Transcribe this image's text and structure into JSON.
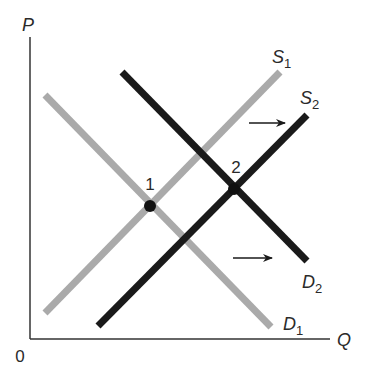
{
  "diagram": {
    "type": "supply-demand",
    "axes": {
      "y_label": "P",
      "x_label": "Q",
      "origin_label": "0"
    },
    "curves": [
      {
        "id": "S1",
        "name": "S",
        "subscript": "1",
        "kind": "supply",
        "color": "#aaaaaa"
      },
      {
        "id": "S2",
        "name": "S",
        "subscript": "2",
        "kind": "supply",
        "color": "#1a1a1a"
      },
      {
        "id": "D1",
        "name": "D",
        "subscript": "1",
        "kind": "demand",
        "color": "#aaaaaa"
      },
      {
        "id": "D2",
        "name": "D",
        "subscript": "2",
        "kind": "demand",
        "color": "#1a1a1a"
      }
    ],
    "equilibria": [
      {
        "label": "1",
        "between": [
          "S1",
          "D1"
        ]
      },
      {
        "label": "2",
        "between": [
          "S2",
          "D2"
        ]
      }
    ],
    "shift_arrows": [
      {
        "of": "supply",
        "direction": "right"
      },
      {
        "of": "demand",
        "direction": "right"
      }
    ],
    "colors": {
      "initial": "#aaaaaa",
      "shifted": "#1a1a1a",
      "axis": "#333333"
    }
  }
}
